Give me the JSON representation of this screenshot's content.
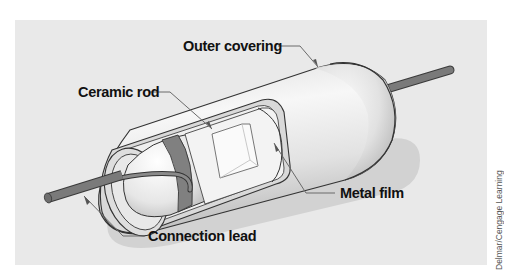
{
  "figure": {
    "colors": {
      "panel_background": "#e9e9e9",
      "body_light": "#f2f2f2",
      "body_shade": "#c8c8c8",
      "lead": "#7a7a7a",
      "band": "#808080",
      "outline": "#333333",
      "shadow": "#d2d2d2",
      "label_text": "#111111"
    },
    "labels": [
      {
        "id": "outer-covering",
        "text": "Outer covering"
      },
      {
        "id": "ceramic-rod",
        "text": "Ceramic rod"
      },
      {
        "id": "metal-film",
        "text": "Metal film"
      },
      {
        "id": "connection-lead",
        "text": "Connection lead"
      }
    ],
    "credit": "Delmar/Cengage Learning"
  }
}
